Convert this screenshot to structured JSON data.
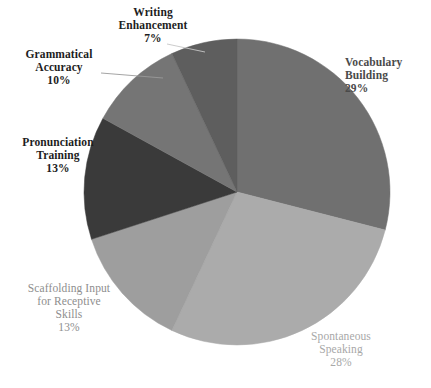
{
  "chart_data": {
    "type": "pie",
    "title": "",
    "subtitle": "",
    "xlabel": "",
    "ylabel": "",
    "legend_position": "none",
    "grid": false,
    "start_angle_deg": 0,
    "direction": "clockwise",
    "center": [
      237,
      192
    ],
    "radius": 153,
    "total": 100,
    "categories": [
      "Vocabulary Building",
      "Spontaneous Speaking",
      "Scaffolding Input for Receptive Skills",
      "Pronunciation Training",
      "Grammatical Accuracy",
      "Writing Enhancement"
    ],
    "values": [
      29,
      28,
      13,
      13,
      10,
      7
    ],
    "value_labels": [
      "29%",
      "28%",
      "13%",
      "13%",
      "10%",
      "7%"
    ],
    "colors": [
      "#707070",
      "#ababab",
      "#9e9e9e",
      "#3a3a3a",
      "#757575",
      "#5e5e5e"
    ],
    "slices": [
      {
        "name": "Vocabulary Building",
        "value": 29,
        "value_label": "29%",
        "color": "#707070",
        "label_lines": [
          "Vocabulary",
          "Building"
        ],
        "label_color": "#4a4a4a",
        "leader_line": false
      },
      {
        "name": "Spontaneous Speaking",
        "value": 28,
        "value_label": "28%",
        "color": "#ababab",
        "label_lines": [
          "Spontaneous",
          "Speaking"
        ],
        "label_color": "#a8a8a8",
        "leader_line": false
      },
      {
        "name": "Scaffolding Input for Receptive Skills",
        "value": 13,
        "value_label": "13%",
        "color": "#9e9e9e",
        "label_lines": [
          "Scaffolding Input",
          "for Receptive",
          "Skills"
        ],
        "label_color": "#8e8e8e",
        "leader_line": false
      },
      {
        "name": "Pronunciation Training",
        "value": 13,
        "value_label": "13%",
        "color": "#3a3a3a",
        "label_lines": [
          "Pronunciation",
          "Training"
        ],
        "label_color": "#1d1d1d",
        "leader_line": false
      },
      {
        "name": "Grammatical Accuracy",
        "value": 10,
        "value_label": "10%",
        "color": "#757575",
        "label_lines": [
          "Grammatical",
          "Accuracy"
        ],
        "label_color": "#1d1d1d",
        "leader_line": true
      },
      {
        "name": "Writing Enhancement",
        "value": 7,
        "value_label": "7%",
        "color": "#5e5e5e",
        "label_lines": [
          "Writing",
          "Enhancement"
        ],
        "label_color": "#1d1d1d",
        "leader_line": true
      }
    ]
  },
  "labels": {
    "vocabulary_building": {
      "line1": "Vocabulary",
      "line2": "Building",
      "pct": "29%"
    },
    "spontaneous_speaking": {
      "line1": "Spontaneous",
      "line2": "Speaking",
      "pct": "28%"
    },
    "scaffolding_input": {
      "line1": "Scaffolding Input",
      "line2": "for Receptive",
      "line3": "Skills",
      "pct": "13%"
    },
    "pronunciation_training": {
      "line1": "Pronunciation",
      "line2": "Training",
      "pct": "13%"
    },
    "grammatical_accuracy": {
      "line1": "Grammatical",
      "line2": "Accuracy",
      "pct": "10%"
    },
    "writing_enhancement": {
      "line1": "Writing",
      "line2": "Enhancement",
      "pct": "7%"
    }
  }
}
